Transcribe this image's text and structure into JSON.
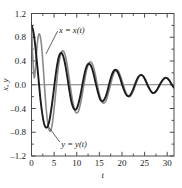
{
  "chart_data": {
    "type": "line",
    "title": "",
    "xlabel": "t",
    "ylabel": "x, y",
    "xlim": [
      0,
      31.5
    ],
    "ylim": [
      -1.2,
      1.2
    ],
    "xticks": [
      0,
      5,
      10,
      15,
      20,
      25,
      30
    ],
    "xtick_labels": [
      "0",
      "5",
      "10",
      "15",
      "20",
      "25",
      "30"
    ],
    "yticks": [
      -1.2,
      -0.8,
      -0.4,
      0.0,
      0.4,
      0.8,
      1.2
    ],
    "ytick_labels": [
      "-1.2",
      "-0.8",
      "-0.4",
      "0.0",
      "0.4",
      "0.8",
      "1.2"
    ],
    "grid": false,
    "legend_position": "inline-annotations",
    "zero_line": true,
    "annotations": [
      {
        "name": "x-curve-label",
        "text": "x = x(t)",
        "x": 6.1,
        "y": 0.92,
        "leader_to_x": 3.2,
        "leader_to_y": 0.52
      },
      {
        "name": "y-curve-label",
        "text": "y = y(t)",
        "x": 6.6,
        "y": -1.0,
        "leader_to_x": 3.9,
        "leader_to_y": -0.72
      }
    ],
    "series": [
      {
        "name": "x = x(t)",
        "color": "#1c1c1c",
        "width": 1.9,
        "description": "slowly damped oscillation, period about 5.1, starts at 1.0",
        "x": [
          0,
          0.4,
          0.8,
          1.2,
          1.6,
          2,
          2.4,
          2.8,
          3.2,
          3.6,
          4,
          4.4,
          4.8,
          5.2,
          5.6,
          6,
          6.4,
          6.8,
          7.2,
          7.6,
          8,
          8.4,
          8.8,
          9.2,
          9.6,
          10,
          10.4,
          10.8,
          11.2,
          11.6,
          12,
          12.4,
          12.8,
          13.2,
          13.6,
          14,
          14.4,
          14.8,
          15.2,
          15.6,
          16,
          16.4,
          16.8,
          17.2,
          17.6,
          18,
          18.4,
          18.8,
          19.2,
          19.6,
          20,
          20.4,
          20.8,
          21.2,
          21.6,
          22,
          22.4,
          22.8,
          23.2,
          23.6,
          24,
          24.4,
          24.8,
          25.2,
          25.6,
          26,
          26.4,
          26.8,
          27.2,
          27.6,
          28,
          28.4,
          28.8,
          29.2,
          29.6,
          30,
          30.4,
          30.8,
          31.2,
          31.5
        ],
        "y": [
          1.0,
          0.9,
          0.68,
          0.38,
          0.06,
          -0.26,
          -0.5,
          -0.66,
          -0.72,
          -0.7,
          -0.59,
          -0.4,
          -0.17,
          0.08,
          0.3,
          0.46,
          0.53,
          0.52,
          0.43,
          0.28,
          0.09,
          -0.11,
          -0.28,
          -0.38,
          -0.42,
          -0.4,
          -0.31,
          -0.18,
          -0.02,
          0.14,
          0.27,
          0.34,
          0.35,
          0.31,
          0.22,
          0.09,
          -0.04,
          -0.16,
          -0.25,
          -0.28,
          -0.26,
          -0.2,
          -0.1,
          0.02,
          0.13,
          0.21,
          0.25,
          0.24,
          0.19,
          0.11,
          0.01,
          -0.08,
          -0.15,
          -0.19,
          -0.19,
          -0.15,
          -0.09,
          -0.01,
          0.07,
          0.13,
          0.16,
          0.16,
          0.13,
          0.07,
          0.0,
          -0.06,
          -0.11,
          -0.14,
          -0.13,
          -0.1,
          -0.05,
          0.01,
          0.06,
          0.1,
          0.12,
          0.11,
          0.08,
          0.03,
          -0.02,
          -0.05
        ]
      },
      {
        "name": "y = y(t)",
        "color": "#8a8a8a",
        "width": 1.6,
        "description": "faster damped oscillation, period about 6.5 with early sharp dip, starts at 1.0",
        "x": [
          0,
          0.3,
          0.6,
          0.9,
          1.2,
          1.5,
          1.8,
          2.1,
          2.4,
          2.7,
          3,
          3.3,
          3.6,
          3.9,
          4.2,
          4.5,
          4.8,
          5.1,
          5.4,
          5.7,
          6,
          6.4,
          6.8,
          7.2,
          7.6,
          8,
          8.4,
          8.8,
          9.2,
          9.6,
          10,
          10.4,
          10.8,
          11.2,
          11.6,
          12,
          12.4,
          12.8,
          13.2,
          13.6,
          14,
          14.4,
          14.8,
          15.2,
          15.6,
          16,
          16.4,
          16.8,
          17.2,
          17.6,
          18,
          18.4,
          18.8,
          19.2,
          19.6,
          20,
          20.4,
          20.8,
          21.2,
          21.6,
          22,
          22.4,
          22.8,
          23.2,
          23.6,
          24,
          24.4,
          24.8,
          25.2,
          25.6,
          26,
          26.4,
          26.8,
          27.2,
          27.6,
          28,
          28.4,
          28.8,
          29.2,
          29.6,
          30,
          30.4,
          30.8,
          31.2,
          31.5
        ],
        "y": [
          1.0,
          0.42,
          0.12,
          0.3,
          0.62,
          0.82,
          0.85,
          0.74,
          0.5,
          0.18,
          -0.16,
          -0.45,
          -0.65,
          -0.76,
          -0.78,
          -0.7,
          -0.54,
          -0.33,
          -0.09,
          0.14,
          0.33,
          0.5,
          0.57,
          0.55,
          0.45,
          0.28,
          0.07,
          -0.14,
          -0.32,
          -0.44,
          -0.48,
          -0.44,
          -0.33,
          -0.17,
          0.01,
          0.18,
          0.31,
          0.38,
          0.38,
          0.32,
          0.21,
          0.06,
          -0.09,
          -0.21,
          -0.29,
          -0.31,
          -0.28,
          -0.19,
          -0.08,
          0.04,
          0.15,
          0.22,
          0.25,
          0.23,
          0.16,
          0.07,
          -0.03,
          -0.12,
          -0.18,
          -0.2,
          -0.18,
          -0.12,
          -0.04,
          0.04,
          0.11,
          0.16,
          0.17,
          0.14,
          0.09,
          0.02,
          -0.05,
          -0.11,
          -0.14,
          -0.14,
          -0.11,
          -0.06,
          0.0,
          0.05,
          0.09,
          0.11,
          0.11,
          0.08,
          0.03,
          -0.01,
          -0.04
        ]
      }
    ]
  },
  "axes": {
    "x_axis_label": "t",
    "y_axis_label": "x, y"
  }
}
